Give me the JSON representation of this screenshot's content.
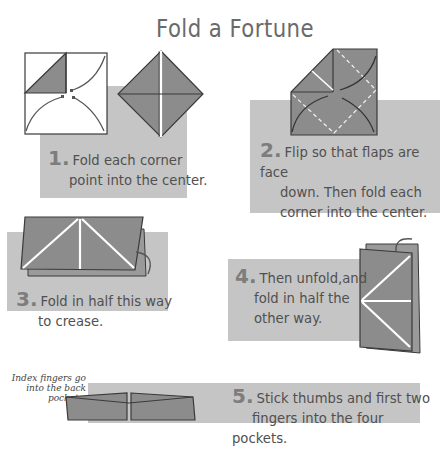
{
  "title": "Fold a Fortune",
  "steps": [
    {
      "number": "1.",
      "line1": "Fold each corner",
      "line2": "point into the center."
    },
    {
      "number": "2.",
      "line1": "Flip so that flaps are face",
      "line2": "down. Then fold each",
      "line3": "corner into the center."
    },
    {
      "number": "3.",
      "line1": "Fold in half this way",
      "line2": "to crease."
    },
    {
      "number": "4.",
      "line1": "Then unfold,and",
      "line2": "fold in half the",
      "line3": "other way."
    },
    {
      "number": "5.",
      "line1": "Stick thumbs and first two",
      "line2": "fingers into the four pockets."
    }
  ],
  "annotation": {
    "line1": "Index fingers go",
    "line2": "into the back pockets."
  },
  "colors": {
    "panel": "#c5c5c5",
    "paper": "#8c8c8c",
    "edge": "#3a3a3a",
    "text": "#505050"
  }
}
